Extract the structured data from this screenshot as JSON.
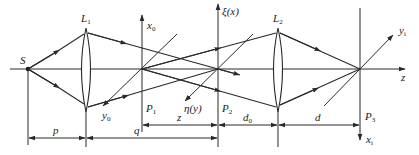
{
  "figure": {
    "type": "optical-system-diagram",
    "labels": {
      "source": "S",
      "lens1": "L",
      "lens1_sub": "1",
      "lens2": "L",
      "lens2_sub": "2",
      "plane1": "P",
      "plane1_sub": "1",
      "plane2": "P",
      "plane2_sub": "2",
      "plane3": "P",
      "plane3_sub": "3",
      "x0_axis": "x",
      "x0_sub": "0",
      "y0_axis": "y",
      "y0_sub": "0",
      "xi_axis": "ξ(x)",
      "eta_axis": "η(y)",
      "yi_axis": "y",
      "yi_sub": "i",
      "xi_out_axis": "x",
      "xi_out_sub": "i",
      "z_axis": "z"
    },
    "dimensions": {
      "p": "p",
      "q": "q",
      "z": "z",
      "d0": "d",
      "d0_sub": "0",
      "d": "d"
    },
    "colors": {
      "line": "#2a2a2a",
      "background": "#ffffff"
    }
  }
}
